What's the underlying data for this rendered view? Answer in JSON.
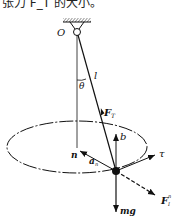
{
  "caption": "张力 F_T 的大小。",
  "diagram": {
    "labels": {
      "pivot": "O",
      "length": "l",
      "angle": "θ",
      "tension": "F",
      "tension_sub": "T",
      "binormal": "b",
      "normal": "n",
      "normal_accel": "a",
      "normal_accel_sub": "n",
      "tangent": "τ",
      "inertial_force": "F",
      "inertial_force_sub": "I",
      "inertial_force_sup": "n",
      "weight": "mg"
    },
    "colors": {
      "ink": "#111111",
      "background": "#ffffff"
    }
  }
}
